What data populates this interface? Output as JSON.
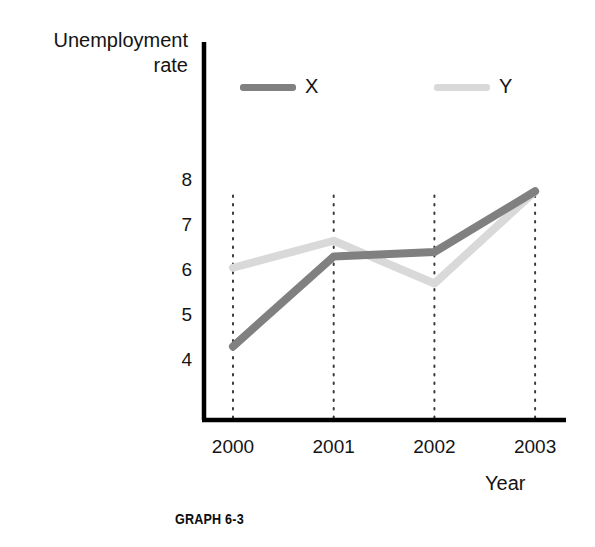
{
  "chart_data": {
    "type": "line",
    "title": "Unemployment\nrate",
    "caption": "GRAPH 6-3",
    "xlabel": "Year",
    "ylabel": "Unemployment rate",
    "categories": [
      "2000",
      "2001",
      "2002",
      "2003"
    ],
    "x": [
      2000,
      2001,
      2002,
      2003
    ],
    "series": [
      {
        "name": "X",
        "values": [
          4.3,
          6.3,
          6.4,
          7.75
        ],
        "color": "#808080"
      },
      {
        "name": "Y",
        "values": [
          6.05,
          6.65,
          5.7,
          7.75
        ],
        "color": "#d9d9d9"
      }
    ],
    "yticks": [
      "8",
      "7",
      "6",
      "5",
      "4"
    ],
    "ytick_values": [
      8,
      7,
      6,
      5,
      4
    ],
    "ylim": [
      3.0,
      9.0
    ],
    "xlim": [
      1999.65,
      2003.45
    ],
    "grid": false,
    "gridlines": "dotted vertical droplines at each year",
    "legend": {
      "position": "top",
      "entries": [
        "X",
        "Y"
      ]
    }
  },
  "axes": {
    "y_axis_label_line1": "Unemployment",
    "y_axis_label_line2": "rate",
    "x_axis_label": "Year"
  },
  "figure": {
    "caption": "GRAPH 6-3"
  },
  "colors": {
    "series_x": "#808080",
    "series_y": "#d9d9d9",
    "axis": "#000000",
    "text": "#141414",
    "background": "#ffffff"
  }
}
